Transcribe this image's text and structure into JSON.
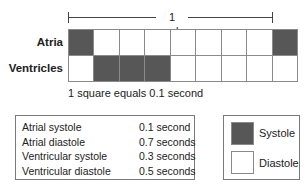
{
  "diagram": {
    "cycle_label": "1 cycle",
    "rows": [
      {
        "label": "Atria",
        "cells": [
          "systole",
          "diastole",
          "diastole",
          "diastole",
          "diastole",
          "diastole",
          "diastole",
          "diastole",
          "systole"
        ]
      },
      {
        "label": "Ventricles",
        "cells": [
          "diastole",
          "systole",
          "systole",
          "systole",
          "diastole",
          "diastole",
          "diastole",
          "diastole",
          "diastole"
        ]
      }
    ],
    "columns": 9,
    "cycle_span_columns": 8,
    "scale_note": "1 square equals 0.1 second"
  },
  "durations": [
    {
      "name": "Atrial systole",
      "value": "0.1 second"
    },
    {
      "name": "Atrial diastole",
      "value": "0.7 seconds"
    },
    {
      "name": "Ventricular systole",
      "value": "0.3 seconds"
    },
    {
      "name": "Ventricular diastole",
      "value": "0.5 seconds"
    }
  ],
  "legend": {
    "items": [
      {
        "label": "Systole",
        "color": "#575757"
      },
      {
        "label": "Diastole",
        "color": "#ffffff"
      }
    ]
  },
  "colors": {
    "systole": "#575757",
    "diastole": "#ffffff",
    "grid_border": "#8a8a8a"
  }
}
